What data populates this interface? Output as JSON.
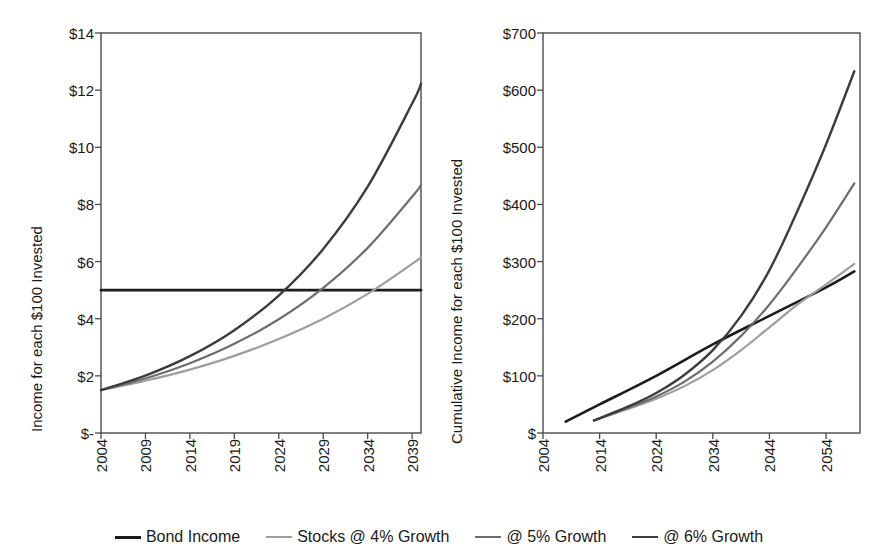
{
  "chart_data": [
    {
      "id": "annual-income",
      "type": "line",
      "title": "",
      "xlabel": "",
      "ylabel": "Income for each $100 Invested",
      "xlim": [
        2004,
        2040
      ],
      "ylim": [
        0,
        14
      ],
      "xticks": [
        2004,
        2009,
        2014,
        2019,
        2024,
        2029,
        2034,
        2039
      ],
      "xticklabels": [
        "2004",
        "2009",
        "2014",
        "2019",
        "2024",
        "2029",
        "2034",
        "2039"
      ],
      "yticks": [
        0,
        2,
        4,
        6,
        8,
        10,
        12,
        14
      ],
      "yticklabels": [
        "$-",
        "$2",
        "$4",
        "$6",
        "$8",
        "$10",
        "$12",
        "$14"
      ],
      "grid": false,
      "series": [
        {
          "name": "Bond Income",
          "color": "#1c1c1c",
          "width": 2.6,
          "x": [
            2004,
            2040
          ],
          "values": [
            5.0,
            5.0
          ]
        },
        {
          "name": "Stocks @ 4% Growth",
          "color": "#9e9e9e",
          "width": 2.2,
          "x": [
            2004,
            2009,
            2014,
            2019,
            2024,
            2029,
            2034,
            2039,
            2040
          ],
          "values": [
            1.5,
            1.83,
            2.22,
            2.7,
            3.29,
            4.0,
            4.87,
            5.92,
            6.16
          ]
        },
        {
          "name": "@ 5% Growth",
          "color": "#6e6e6e",
          "width": 2.2,
          "x": [
            2004,
            2009,
            2014,
            2019,
            2024,
            2029,
            2034,
            2039,
            2040
          ],
          "values": [
            1.5,
            1.91,
            2.44,
            3.12,
            3.98,
            5.08,
            6.48,
            8.27,
            8.68
          ]
        },
        {
          "name": "@ 6% Growth",
          "color": "#3c3c3c",
          "width": 2.4,
          "x": [
            2004,
            2009,
            2014,
            2019,
            2024,
            2029,
            2034,
            2039,
            2040
          ],
          "values": [
            1.5,
            2.01,
            2.69,
            3.6,
            4.81,
            6.44,
            8.62,
            11.53,
            12.22
          ]
        }
      ]
    },
    {
      "id": "cumulative-income",
      "type": "line",
      "title": "",
      "xlabel": "",
      "ylabel": "Cumulative Income for each $100 Invested",
      "xlim": [
        2004,
        2060
      ],
      "ylim": [
        0,
        700
      ],
      "xticks": [
        2004,
        2014,
        2024,
        2034,
        2044,
        2054
      ],
      "xticklabels": [
        "2004",
        "2014",
        "2024",
        "2034",
        "2044",
        "2054"
      ],
      "yticks": [
        0,
        100,
        200,
        300,
        400,
        500,
        600,
        700
      ],
      "yticklabels": [
        "$",
        "$100",
        "$200",
        "$300",
        "$400",
        "$500",
        "$600",
        "$700"
      ],
      "grid": false,
      "series": [
        {
          "name": "Bond Income",
          "color": "#1c1c1c",
          "width": 2.6,
          "x": [
            2008,
            2014,
            2024,
            2034,
            2044,
            2054,
            2059
          ],
          "values": [
            20,
            50,
            100,
            155,
            205,
            255,
            283
          ]
        },
        {
          "name": "Stocks @ 4% Growth",
          "color": "#9e9e9e",
          "width": 2.2,
          "x": [
            2013,
            2019,
            2024,
            2029,
            2034,
            2039,
            2044,
            2049,
            2054,
            2059
          ],
          "values": [
            22,
            42,
            60,
            82,
            110,
            145,
            185,
            225,
            260,
            296
          ]
        },
        {
          "name": "@ 5% Growth",
          "color": "#6e6e6e",
          "width": 2.2,
          "x": [
            2013,
            2019,
            2024,
            2029,
            2034,
            2039,
            2044,
            2049,
            2054,
            2059
          ],
          "values": [
            22,
            44,
            64,
            90,
            125,
            170,
            225,
            290,
            360,
            437
          ]
        },
        {
          "name": "@ 6% Growth",
          "color": "#3c3c3c",
          "width": 2.4,
          "x": [
            2013,
            2019,
            2024,
            2029,
            2034,
            2039,
            2044,
            2049,
            2054,
            2059
          ],
          "values": [
            22,
            46,
            70,
            102,
            145,
            205,
            285,
            390,
            505,
            633
          ]
        }
      ]
    }
  ],
  "legend": {
    "position": "bottom-center",
    "items": [
      {
        "label": "Bond Income",
        "color": "#1c1c1c",
        "width": 3.0
      },
      {
        "label": "Stocks @ 4% Growth",
        "color": "#9e9e9e",
        "width": 2.2
      },
      {
        "label": "@ 5% Growth",
        "color": "#6e6e6e",
        "width": 2.2
      },
      {
        "label": "@ 6% Growth",
        "color": "#3c3c3c",
        "width": 2.6
      }
    ]
  }
}
